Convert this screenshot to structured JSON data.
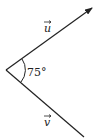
{
  "diagram": {
    "type": "vector-angle",
    "vectors": [
      {
        "name": "u",
        "label": "u",
        "has_arrow": true
      },
      {
        "name": "v",
        "label": "v",
        "has_arrow": false
      }
    ],
    "angle": {
      "value": 75,
      "label": "75°"
    },
    "colors": {
      "stroke": "#222222",
      "background": "#ffffff"
    }
  }
}
